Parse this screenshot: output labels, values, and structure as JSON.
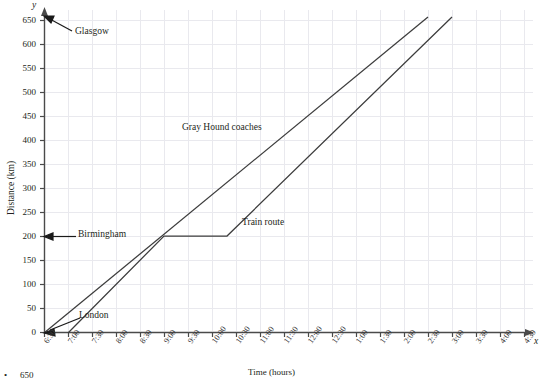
{
  "chart_data": {
    "type": "line",
    "title": "",
    "xlabel": "Time (hours)",
    "ylabel": "Distance (km)",
    "x_axis_symbol": "x",
    "y_axis_symbol": "y",
    "grid": true,
    "xlim": [
      0,
      21
    ],
    "ylim": [
      0,
      650
    ],
    "y_ticks": [
      0,
      50,
      100,
      150,
      200,
      250,
      300,
      350,
      400,
      450,
      500,
      550,
      600,
      650
    ],
    "x_ticks": [
      "6:30",
      "7:00",
      "7:30",
      "8:00",
      "8:30",
      "9:00",
      "9:30",
      "10:00",
      "10:30",
      "11:00",
      "11:30",
      "12:00",
      "12:30",
      "1:00",
      "1:30",
      "2:00",
      "2:30",
      "3:00",
      "3:30",
      "4:00",
      "4:30"
    ],
    "series": [
      {
        "name": "Gray Hound coaches",
        "label_position": {
          "x": 182,
          "y": 129
        },
        "points": [
          {
            "time": "6:30",
            "distance": 0
          },
          {
            "time": "2:30",
            "distance": 650
          }
        ]
      },
      {
        "name": "Train route",
        "label_position": {
          "x": 242,
          "y": 224
        },
        "points": [
          {
            "time": "7:00",
            "distance": 0
          },
          {
            "time": "8:55",
            "distance": 200
          },
          {
            "time": "10:15",
            "distance": 200
          },
          {
            "time": "3:00",
            "distance": 650
          }
        ]
      }
    ],
    "annotations": [
      {
        "name": "Glasgow",
        "label": "Glasgow",
        "distance": 650,
        "target": "y-axis"
      },
      {
        "name": "Birmingham",
        "label": "Birmingham",
        "distance": 200,
        "target": "y-axis"
      },
      {
        "name": "London",
        "label": "London",
        "distance": 0,
        "target": "origin"
      }
    ],
    "colors": {
      "line": "#3c3c3c",
      "grid": "#e6e6ea",
      "axis": "#4a4a4a",
      "text": "#231f20"
    }
  },
  "footnote": {
    "bullet": "•",
    "text": "650"
  }
}
